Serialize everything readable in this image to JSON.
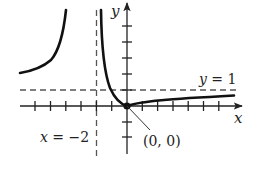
{
  "diagram": {
    "type": "function-graph",
    "axes": {
      "x_label": "x",
      "y_label": "y",
      "origin_px": [
        127,
        106
      ],
      "unit_px": 15.3,
      "x_ticks": [
        -6,
        -5,
        -4,
        -3,
        -2,
        -1,
        1,
        2,
        3,
        4,
        5,
        6
      ],
      "y_ticks": [
        -2,
        -1,
        1,
        2,
        3,
        4,
        5
      ]
    },
    "asymptotes": {
      "vertical": {
        "equation": "x = −2",
        "x_value": -2
      },
      "horizontal": {
        "equation": "y = 1",
        "y_value": 1
      }
    },
    "labels": {
      "y_axis": "y",
      "x_axis": "x",
      "horizontal_asymptote": "y = 1",
      "vertical_asymptote_lhs": "x",
      "vertical_asymptote_rhs": " = −2",
      "point": "(0, 0)"
    },
    "points": [
      {
        "label": "(0, 0)",
        "x": 0,
        "y": 0
      }
    ],
    "colors": {
      "curve": "#111111",
      "axis": "#222222",
      "dashed": "#555555",
      "background": "#ffffff"
    }
  }
}
